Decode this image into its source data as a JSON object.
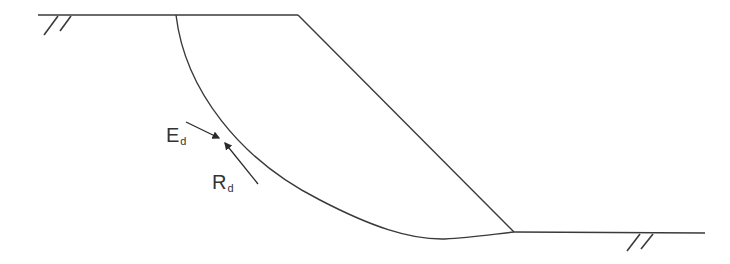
{
  "diagram": {
    "line_color": "#3a3a3a",
    "labels": {
      "action": {
        "main": "E",
        "sub": "d"
      },
      "resistance": {
        "main": "R",
        "sub": "d"
      }
    },
    "elements": [
      "upper-ground-surface",
      "slope-face",
      "lower-ground-surface",
      "slip-circle-arc",
      "action-arrow-Ed",
      "resistance-arrow-Rd",
      "ground-hatch-left",
      "ground-hatch-right"
    ]
  }
}
